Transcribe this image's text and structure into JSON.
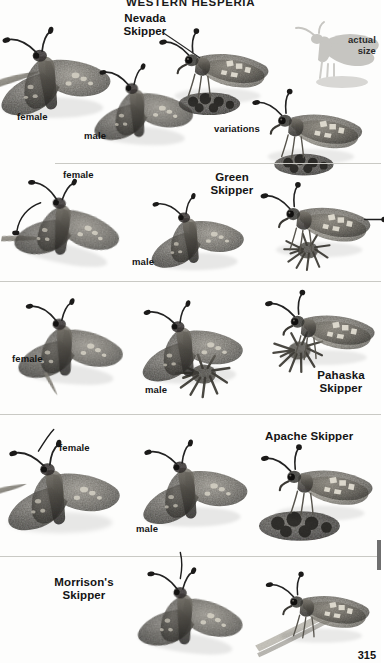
{
  "page": {
    "running_head": "WESTERN HESPERIA",
    "folio": "315",
    "background_color": "#fdfdfc",
    "rule_color": "#c9c9c4"
  },
  "actual_size_note": {
    "text": "actual\nsize",
    "silhouette_color": "#c4c4c0"
  },
  "rows": [
    {
      "species": "Nevada\nSkipper",
      "specimens": [
        {
          "sex_label": "female",
          "view": "dorsal-spread",
          "pose": "perched-on-stem"
        },
        {
          "sex_label": "male",
          "view": "dorsal-spread",
          "pose": "perched"
        },
        {
          "sex_label": "",
          "view": "ventral-lateral",
          "pose": "on-scat"
        },
        {
          "sex_label": "",
          "view": "ventral-lateral",
          "pose": "on-scat"
        }
      ],
      "notes": [
        "variations"
      ]
    },
    {
      "species": "Green\nSkipper",
      "specimens": [
        {
          "sex_label": "female",
          "view": "dorsal-spread",
          "pose": "on-twig"
        },
        {
          "sex_label": "male",
          "view": "dorsal-spread",
          "pose": "perched"
        },
        {
          "sex_label": "",
          "view": "ventral-lateral",
          "pose": "nectaring"
        }
      ],
      "notes": []
    },
    {
      "species": "Pahaska\nSkipper",
      "specimens": [
        {
          "sex_label": "female",
          "view": "dorsal-spread",
          "pose": "perched"
        },
        {
          "sex_label": "male",
          "view": "dorsal-spread",
          "pose": "on-flower"
        },
        {
          "sex_label": "",
          "view": "ventral-lateral",
          "pose": "on-flower"
        }
      ],
      "notes": []
    },
    {
      "species": "Apache Skipper",
      "specimens": [
        {
          "sex_label": "female",
          "view": "dorsal-spread",
          "pose": "perched"
        },
        {
          "sex_label": "male",
          "view": "dorsal-spread",
          "pose": "perched"
        },
        {
          "sex_label": "",
          "view": "ventral-lateral",
          "pose": "on-scat"
        }
      ],
      "notes": []
    },
    {
      "species": "Morrison's\nSkipper",
      "specimens": [
        {
          "sex_label": "",
          "view": "dorsal-spread",
          "pose": "perched"
        },
        {
          "sex_label": "",
          "view": "ventral-lateral",
          "pose": "on-grass-blade"
        }
      ],
      "notes": []
    }
  ]
}
